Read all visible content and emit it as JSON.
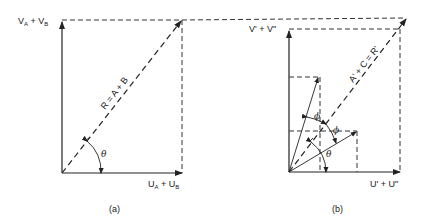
{
  "figure_a": {
    "caption": "(a)",
    "y_axis_label": {
      "main1": "V",
      "sub1": "A",
      "plus": " + ",
      "main2": "V",
      "sub2": "B"
    },
    "x_axis_label": {
      "main1": "U",
      "sub1": "A",
      "plus": " + ",
      "main2": "U",
      "sub2": "B"
    },
    "resultant_label": "R = A + B",
    "angle_label": "θ"
  },
  "figure_b": {
    "caption": "(b)",
    "y_axis_label": "V' + V\"",
    "x_axis_label": "U' + U\"",
    "resultant_label": "A' + C = R'",
    "angle_theta": "θ",
    "angle_phi_1": "ϕ",
    "angle_phi_2": "ϕ"
  }
}
